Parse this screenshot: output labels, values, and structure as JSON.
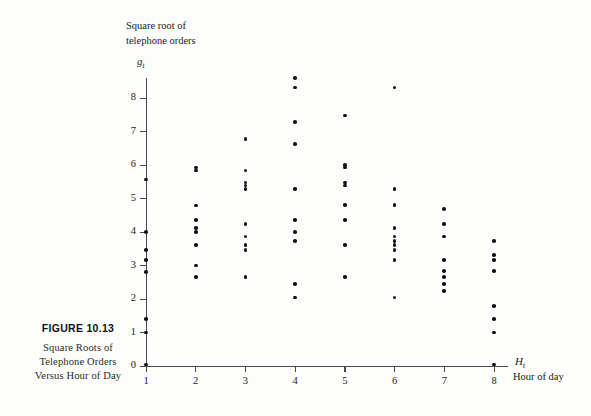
{
  "figure": {
    "number": "FIGURE 10.13",
    "caption_lines": [
      "Square Roots of",
      "Telephone Orders",
      "Versus Hour of Day"
    ]
  },
  "axis_titles": {
    "y_lines": [
      "Square root of",
      "telephone orders"
    ],
    "y_symbol": "g",
    "y_symbol_sub": "t",
    "x_symbol": "H",
    "x_symbol_sub": "t",
    "x_label": "Hour of day"
  },
  "chart_data": {
    "type": "scatter",
    "title": "Square Roots of Telephone Orders Versus Hour of Day",
    "xlabel": "Hour of day",
    "ylabel": "Square root of telephone orders",
    "xlim": [
      0.6,
      8.4
    ],
    "ylim": [
      0,
      8.8
    ],
    "xticks": [
      1,
      2,
      3,
      4,
      5,
      6,
      7,
      8
    ],
    "yticks": [
      0,
      1,
      2,
      3,
      4,
      5,
      6,
      7,
      8
    ],
    "grid": false,
    "legend": null,
    "marker_color": "#111111",
    "axis_color": "#4a4a4a",
    "points": [
      {
        "x": 1,
        "y": 5.57
      },
      {
        "x": 1,
        "y": 4.0
      },
      {
        "x": 1,
        "y": 3.46
      },
      {
        "x": 1,
        "y": 3.16
      },
      {
        "x": 1,
        "y": 2.8
      },
      {
        "x": 1,
        "y": 1.41
      },
      {
        "x": 1,
        "y": 1.0
      },
      {
        "x": 1,
        "y": 0.05
      },
      {
        "x": 2,
        "y": 5.92
      },
      {
        "x": 2,
        "y": 5.83
      },
      {
        "x": 2,
        "y": 4.79
      },
      {
        "x": 2,
        "y": 4.36
      },
      {
        "x": 2,
        "y": 4.12
      },
      {
        "x": 2,
        "y": 4.0
      },
      {
        "x": 2,
        "y": 3.61
      },
      {
        "x": 2,
        "y": 3.0
      },
      {
        "x": 2,
        "y": 2.65
      },
      {
        "x": 3,
        "y": 6.78
      },
      {
        "x": 3,
        "y": 5.83
      },
      {
        "x": 3,
        "y": 5.48
      },
      {
        "x": 3,
        "y": 5.39
      },
      {
        "x": 3,
        "y": 5.29
      },
      {
        "x": 3,
        "y": 4.24
      },
      {
        "x": 3,
        "y": 3.87
      },
      {
        "x": 3,
        "y": 3.61
      },
      {
        "x": 3,
        "y": 3.46
      },
      {
        "x": 3,
        "y": 2.65
      },
      {
        "x": 4,
        "y": 8.6
      },
      {
        "x": 4,
        "y": 8.31
      },
      {
        "x": 4,
        "y": 7.28
      },
      {
        "x": 4,
        "y": 6.63
      },
      {
        "x": 4,
        "y": 5.29
      },
      {
        "x": 4,
        "y": 4.36
      },
      {
        "x": 4,
        "y": 4.0
      },
      {
        "x": 4,
        "y": 3.74
      },
      {
        "x": 4,
        "y": 2.45
      },
      {
        "x": 4,
        "y": 2.05
      },
      {
        "x": 5,
        "y": 7.48
      },
      {
        "x": 5,
        "y": 6.0
      },
      {
        "x": 5,
        "y": 5.92
      },
      {
        "x": 5,
        "y": 5.48
      },
      {
        "x": 5,
        "y": 5.39
      },
      {
        "x": 5,
        "y": 4.8
      },
      {
        "x": 5,
        "y": 4.36
      },
      {
        "x": 5,
        "y": 3.61
      },
      {
        "x": 5,
        "y": 2.65
      },
      {
        "x": 6,
        "y": 8.31
      },
      {
        "x": 6,
        "y": 5.29
      },
      {
        "x": 6,
        "y": 4.8
      },
      {
        "x": 6,
        "y": 4.12
      },
      {
        "x": 6,
        "y": 3.87
      },
      {
        "x": 6,
        "y": 3.74
      },
      {
        "x": 6,
        "y": 3.61
      },
      {
        "x": 6,
        "y": 3.46
      },
      {
        "x": 6,
        "y": 3.16
      },
      {
        "x": 6,
        "y": 2.04
      },
      {
        "x": 7,
        "y": 4.69
      },
      {
        "x": 7,
        "y": 4.24
      },
      {
        "x": 7,
        "y": 3.87
      },
      {
        "x": 7,
        "y": 3.16
      },
      {
        "x": 7,
        "y": 2.83
      },
      {
        "x": 7,
        "y": 2.65
      },
      {
        "x": 7,
        "y": 2.45
      },
      {
        "x": 7,
        "y": 2.24
      },
      {
        "x": 8,
        "y": 3.74
      },
      {
        "x": 8,
        "y": 3.32
      },
      {
        "x": 8,
        "y": 3.16
      },
      {
        "x": 8,
        "y": 2.83
      },
      {
        "x": 8,
        "y": 1.79
      },
      {
        "x": 8,
        "y": 1.41
      },
      {
        "x": 8,
        "y": 1.0
      },
      {
        "x": 8,
        "y": 0.05
      }
    ]
  }
}
